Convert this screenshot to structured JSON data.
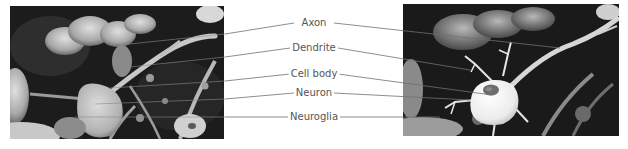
{
  "figure": {
    "left_image": {
      "description": "Scanning electron micrograph of neural tissue (neuron and neuroglia)"
    },
    "right_image": {
      "description": "Same micrograph with illustrated neuron overlay showing cell body, nucleus, dendrites and axon"
    },
    "labels": [
      {
        "id": "axon",
        "text": "Axon",
        "x": 314,
        "y": 23
      },
      {
        "id": "dendrite",
        "text": "Dendrite",
        "x": 314,
        "y": 48
      },
      {
        "id": "cell-body",
        "text": "Cell body",
        "x": 314,
        "y": 74
      },
      {
        "id": "neuron",
        "text": "Neuron",
        "x": 314,
        "y": 93
      },
      {
        "id": "neuroglia",
        "text": "Neuroglia",
        "x": 314,
        "y": 117
      }
    ],
    "colors": {
      "line": "#707070",
      "text": "#555555",
      "background": "#ffffff"
    }
  }
}
